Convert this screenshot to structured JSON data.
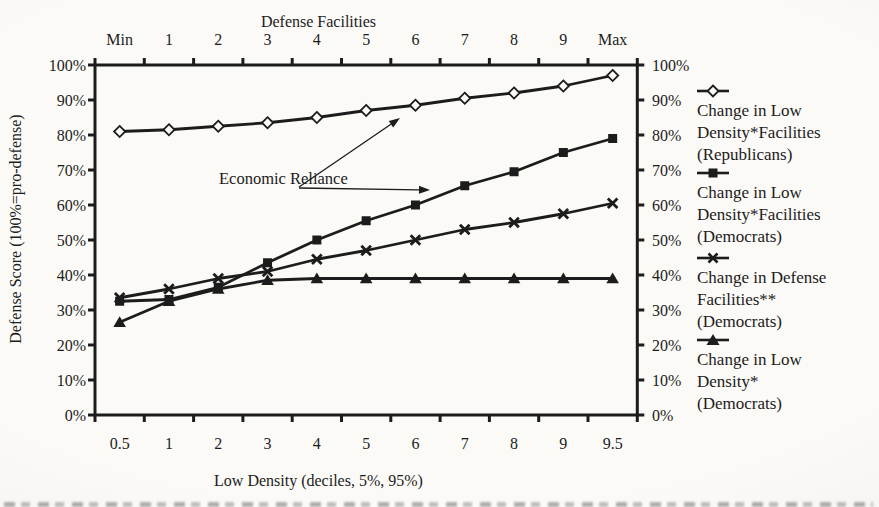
{
  "chart_data": {
    "type": "line",
    "grid": false,
    "legend_position": "right",
    "top_axis": {
      "title": "Defense Facilities",
      "tick_labels": [
        "Min",
        "1",
        "2",
        "3",
        "4",
        "5",
        "6",
        "7",
        "8",
        "9",
        "Max"
      ]
    },
    "bottom_axis": {
      "title": "Low Density (deciles, 5%, 95%)",
      "tick_labels": [
        "0.5",
        "1",
        "2",
        "3",
        "4",
        "5",
        "6",
        "7",
        "8",
        "9",
        "9.5"
      ]
    },
    "left_axis": {
      "title": "Defense Score (100%=pro-defense)",
      "range": [
        0,
        100
      ],
      "tick_labels": [
        "0%",
        "10%",
        "20%",
        "30%",
        "40%",
        "50%",
        "60%",
        "70%",
        "80%",
        "90%",
        "100%"
      ]
    },
    "right_axis": {
      "tick_labels": [
        "0%",
        "10%",
        "20%",
        "30%",
        "40%",
        "50%",
        "60%",
        "70%",
        "80%",
        "90%",
        "100%"
      ]
    },
    "series": [
      {
        "name": "Change in Low Density*Facilities (Republicans)",
        "legend_lines": [
          "Change in Low",
          "Density*Facilities",
          "(Republicans)"
        ],
        "marker": "diamond-open",
        "values": [
          81,
          81.5,
          82.5,
          83.5,
          85,
          87,
          88.5,
          90.5,
          92,
          94,
          97
        ]
      },
      {
        "name": "Change in Low Density*Facilities (Democrats)",
        "legend_lines": [
          "Change in Low",
          "Density*Facilities",
          "(Democrats)"
        ],
        "marker": "square-filled",
        "values": [
          32.5,
          33,
          36.5,
          43.5,
          50,
          55.5,
          60,
          65.5,
          69.5,
          75,
          79
        ]
      },
      {
        "name": "Change in Defense Facilities** (Democrats)",
        "legend_lines": [
          "Change in Defense",
          "Facilities**",
          "(Democrats)"
        ],
        "marker": "x",
        "values": [
          33.5,
          36,
          39,
          41,
          44.5,
          47,
          50,
          53,
          55,
          57.5,
          60.5
        ]
      },
      {
        "name": "Change in Low Density* (Democrats)",
        "legend_lines": [
          "Change in Low",
          "Density*",
          "(Democrats)"
        ],
        "marker": "triangle-filled",
        "values": [
          26.5,
          32.5,
          36,
          38.5,
          39,
          39,
          39,
          39,
          39,
          39,
          39
        ]
      }
    ],
    "annotation": {
      "line1": "Economic",
      "line2": "Reliance"
    },
    "colors": {
      "line": "#1c1c1c",
      "text": "#1c1c1c",
      "background": "#fbfaf7"
    }
  }
}
